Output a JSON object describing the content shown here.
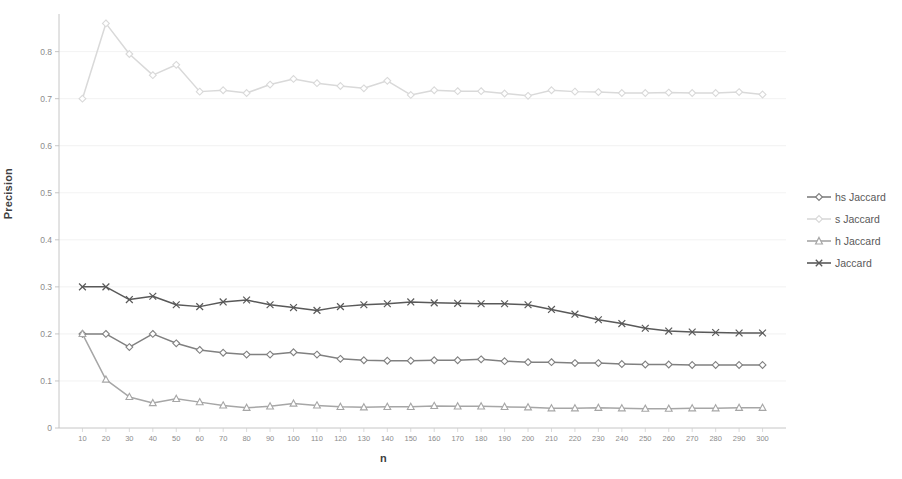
{
  "chart_data": {
    "type": "line",
    "title": "",
    "xlabel": "n",
    "ylabel": "Precision",
    "xlim": [
      0,
      310
    ],
    "ylim": [
      0,
      0.88
    ],
    "grid": true,
    "legend_position": "right",
    "x": [
      10,
      20,
      30,
      40,
      50,
      60,
      70,
      80,
      90,
      100,
      110,
      120,
      130,
      140,
      150,
      160,
      170,
      180,
      190,
      200,
      210,
      220,
      230,
      240,
      250,
      260,
      270,
      280,
      290,
      300
    ],
    "xticks": [
      "10",
      "20",
      "30",
      "40",
      "50",
      "60",
      "70",
      "80",
      "90",
      "100",
      "110",
      "120",
      "130",
      "140",
      "150",
      "160",
      "170",
      "180",
      "190",
      "200",
      "210",
      "220",
      "230",
      "240",
      "250",
      "260",
      "270",
      "280",
      "290",
      "300"
    ],
    "yticks": [
      "0",
      "0.1",
      "0.2",
      "0.3",
      "0.4",
      "0.5",
      "0.6",
      "0.7",
      "0.8"
    ],
    "ytick_values": [
      0,
      0.1,
      0.2,
      0.3,
      0.4,
      0.5,
      0.6,
      0.7,
      0.8
    ],
    "series": [
      {
        "name": "hs Jaccard",
        "color": "#808080",
        "marker": "diamond",
        "values": [
          0.2,
          0.2,
          0.172,
          0.2,
          0.18,
          0.166,
          0.16,
          0.156,
          0.156,
          0.161,
          0.156,
          0.147,
          0.144,
          0.143,
          0.143,
          0.144,
          0.144,
          0.146,
          0.142,
          0.14,
          0.14,
          0.138,
          0.138,
          0.136,
          0.135,
          0.135,
          0.134,
          0.134,
          0.134,
          0.134
        ]
      },
      {
        "name": "s Jaccard",
        "color": "#d9d9d9",
        "marker": "diamond",
        "values": [
          0.7,
          0.86,
          0.795,
          0.75,
          0.772,
          0.715,
          0.718,
          0.712,
          0.73,
          0.742,
          0.733,
          0.727,
          0.722,
          0.738,
          0.708,
          0.718,
          0.716,
          0.716,
          0.711,
          0.706,
          0.718,
          0.715,
          0.714,
          0.712,
          0.712,
          0.713,
          0.712,
          0.712,
          0.714,
          0.709
        ]
      },
      {
        "name": "h Jaccard",
        "color": "#a6a6a6",
        "marker": "triangle",
        "values": [
          0.2,
          0.103,
          0.066,
          0.053,
          0.062,
          0.055,
          0.048,
          0.043,
          0.046,
          0.052,
          0.048,
          0.045,
          0.044,
          0.045,
          0.045,
          0.047,
          0.046,
          0.046,
          0.045,
          0.044,
          0.042,
          0.042,
          0.043,
          0.042,
          0.041,
          0.041,
          0.042,
          0.042,
          0.043,
          0.043
        ]
      },
      {
        "name": "Jaccard",
        "color": "#595959",
        "marker": "cross",
        "values": [
          0.3,
          0.3,
          0.273,
          0.28,
          0.262,
          0.258,
          0.268,
          0.272,
          0.262,
          0.256,
          0.25,
          0.258,
          0.262,
          0.264,
          0.268,
          0.266,
          0.265,
          0.264,
          0.264,
          0.262,
          0.252,
          0.242,
          0.23,
          0.222,
          0.212,
          0.206,
          0.204,
          0.203,
          0.202,
          0.202
        ]
      }
    ]
  },
  "legend": {
    "items": [
      {
        "label": "hs Jaccard"
      },
      {
        "label": "s Jaccard"
      },
      {
        "label": "h Jaccard"
      },
      {
        "label": "Jaccard"
      }
    ]
  }
}
